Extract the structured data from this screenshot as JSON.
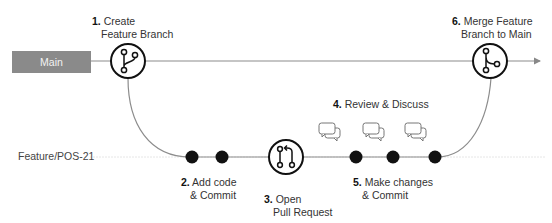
{
  "branches": {
    "main": {
      "label": "Main",
      "color": "#8a8a8a"
    },
    "feature": {
      "label": "Feature/POS-21"
    }
  },
  "steps": [
    {
      "num": "1.",
      "line1": "Create",
      "line2": "Feature Branch",
      "icon": "git-branch-icon"
    },
    {
      "num": "2.",
      "line1": "Add code",
      "line2": "& Commit",
      "icon": "commit-dot"
    },
    {
      "num": "3.",
      "line1": "Open",
      "line2": "Pull Request",
      "icon": "pull-request-icon"
    },
    {
      "num": "4.",
      "line1": "Review & Discuss",
      "line2": "",
      "icon": "chat-bubbles-icon"
    },
    {
      "num": "5.",
      "line1": "Make changes",
      "line2": "& Commit",
      "icon": "commit-dot"
    },
    {
      "num": "6.",
      "line1": "Merge Feature",
      "line2": "Branch to Main",
      "icon": "git-merge-icon"
    }
  ],
  "colors": {
    "line": "#8c8c8c",
    "dot": "#111111",
    "icon_stroke": "#111111"
  }
}
